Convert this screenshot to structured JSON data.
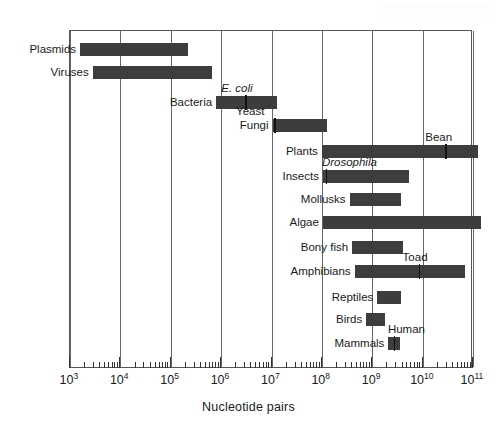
{
  "chart_data": {
    "type": "bar",
    "orientation": "horizontal",
    "scale": "log10",
    "title": "",
    "xlabel": "Nucleotide pairs",
    "ylabel": "",
    "xlim": [
      1000,
      100000000000.0
    ],
    "xlim_exponents": [
      3,
      11
    ],
    "grid": true,
    "grid_axis": "x",
    "legend": "none",
    "bar_color": "#3d3d3d",
    "axis_tick_labels": [
      {
        "base": "10",
        "exp": "3"
      },
      {
        "base": "10",
        "exp": "4"
      },
      {
        "base": "10",
        "exp": "5"
      },
      {
        "base": "10",
        "exp": "6"
      },
      {
        "base": "10",
        "exp": "7"
      },
      {
        "base": "10",
        "exp": "8"
      },
      {
        "base": "10",
        "exp": "9"
      },
      {
        "base": "10",
        "exp": "10"
      },
      {
        "base": "10",
        "exp": "11"
      }
    ],
    "categories": [
      "Plasmids",
      "Viruses",
      "Bacteria",
      "Fungi",
      "Plants",
      "Insects",
      "Mollusks",
      "Algae",
      "Bony fish",
      "Amphibians",
      "Reptiles",
      "Birds",
      "Mammals"
    ],
    "ranges": [
      {
        "label": "Plasmids",
        "min_exp": 3.2,
        "max_exp": 5.35,
        "label_side": "left"
      },
      {
        "label": "Viruses",
        "min_exp": 3.45,
        "max_exp": 5.82,
        "label_side": "left"
      },
      {
        "label": "Bacteria",
        "min_exp": 5.9,
        "max_exp": 7.1,
        "label_side": "left"
      },
      {
        "label": "Fungi",
        "min_exp": 7.02,
        "max_exp": 8.1,
        "label_side": "left"
      },
      {
        "label": "Plants",
        "min_exp": 8.0,
        "max_exp": 11.1,
        "label_side": "left"
      },
      {
        "label": "Insects",
        "min_exp": 8.02,
        "max_exp": 9.72,
        "label_side": "left"
      },
      {
        "label": "Mollusks",
        "min_exp": 8.55,
        "max_exp": 9.58,
        "label_side": "left"
      },
      {
        "label": "Algae",
        "min_exp": 8.02,
        "max_exp": 11.15,
        "label_side": "left"
      },
      {
        "label": "Bony fish",
        "min_exp": 8.6,
        "max_exp": 9.62,
        "label_side": "left"
      },
      {
        "label": "Amphibians",
        "min_exp": 8.65,
        "max_exp": 10.85,
        "label_side": "left"
      },
      {
        "label": "Reptiles",
        "min_exp": 9.1,
        "max_exp": 9.58,
        "label_side": "left"
      },
      {
        "label": "Birds",
        "min_exp": 8.88,
        "max_exp": 9.25,
        "label_side": "left"
      },
      {
        "label": "Mammals",
        "min_exp": 9.32,
        "max_exp": 9.55,
        "label_side": "left"
      }
    ],
    "markers": [
      {
        "label": "E. coli",
        "series": "Bacteria",
        "exp": 6.48,
        "italic": true,
        "label_pos": "above"
      },
      {
        "label": "Yeast",
        "series": "Fungi",
        "exp": 7.05,
        "italic": false,
        "label_pos": "above"
      },
      {
        "label": "Bean",
        "series": "Plants",
        "exp": 10.45,
        "italic": false,
        "label_pos": "above"
      },
      {
        "label": "Drosophila",
        "series": "Insects",
        "exp": 8.08,
        "italic": true,
        "label_pos": "above"
      },
      {
        "label": "Toad",
        "series": "Amphibians",
        "exp": 9.92,
        "italic": false,
        "label_pos": "above"
      },
      {
        "label": "Human",
        "series": "Mammals",
        "exp": 9.43,
        "italic": false,
        "label_pos": "above"
      }
    ]
  }
}
